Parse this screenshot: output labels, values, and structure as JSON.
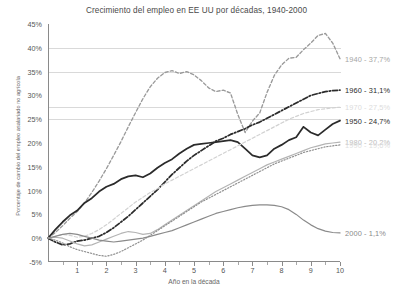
{
  "chart_data": {
    "type": "line",
    "title": "Crecimiento del empleo en EE UU por décadas, 1940-2000",
    "xlabel": "Año en la década",
    "ylabel": "Porcentaje de cambio del empleo asalariado no agrícola",
    "xlim": [
      0,
      10
    ],
    "ylim": [
      -5,
      45
    ],
    "grid": true,
    "legend_position": "right-end-labels",
    "yticks": [
      "-5%",
      "0%",
      "5%",
      "10%",
      "15%",
      "20%",
      "25%",
      "30%",
      "35%",
      "40%",
      "45%"
    ],
    "ytick_values": [
      -5,
      0,
      5,
      10,
      15,
      20,
      25,
      30,
      35,
      40,
      45
    ],
    "xticks": [
      "1",
      "2",
      "3",
      "4",
      "5",
      "6",
      "7",
      "8",
      "9",
      "10"
    ],
    "xtick_values": [
      1,
      2,
      3,
      4,
      5,
      6,
      7,
      8,
      9,
      10
    ],
    "x": [
      0,
      0.25,
      0.5,
      0.75,
      1,
      1.25,
      1.5,
      1.75,
      2,
      2.25,
      2.5,
      2.75,
      3,
      3.25,
      3.5,
      3.75,
      4,
      4.25,
      4.5,
      4.75,
      5,
      5.25,
      5.5,
      5.75,
      6,
      6.25,
      6.5,
      6.75,
      7,
      7.25,
      7.5,
      7.75,
      8,
      8.25,
      8.5,
      8.75,
      9,
      9.25,
      9.5,
      9.75,
      10
    ],
    "series": [
      {
        "name": "1940",
        "label": "1940 - 37,7%",
        "final_value": 37.7,
        "color": "#9a9a9a",
        "style": "dashed",
        "values": [
          0,
          1.2,
          2.6,
          4.2,
          5.6,
          7.4,
          9.6,
          12.0,
          14.6,
          17.4,
          20.3,
          23.4,
          26.4,
          29.3,
          31.8,
          33.6,
          34.8,
          35.2,
          34.6,
          35.0,
          34.3,
          33.1,
          31.6,
          30.8,
          31.1,
          30.5,
          26.0,
          22.2,
          24.6,
          26.3,
          30.6,
          34.2,
          36.4,
          37.8,
          38.0,
          39.6,
          41.0,
          42.6,
          43.0,
          41.0,
          37.7
        ]
      },
      {
        "name": "1950",
        "label": "1950 - 24,7%",
        "final_value": 24.7,
        "color": "#2b2b2b",
        "style": "solid",
        "values": [
          0,
          1.8,
          3.4,
          4.8,
          5.8,
          7.4,
          8.4,
          9.8,
          10.8,
          11.4,
          12.4,
          13.0,
          13.2,
          12.8,
          13.6,
          14.8,
          15.8,
          16.6,
          17.8,
          18.8,
          19.6,
          19.8,
          20.0,
          20.2,
          20.4,
          20.6,
          20.2,
          18.8,
          17.4,
          17.0,
          17.4,
          18.8,
          19.6,
          20.6,
          21.2,
          23.4,
          22.2,
          21.6,
          22.8,
          24.0,
          24.7
        ]
      },
      {
        "name": "1960",
        "label": "1960 - 31,1%",
        "final_value": 31.1,
        "color": "#2b2b2b",
        "style": "dashdot",
        "values": [
          0,
          -0.8,
          -1.4,
          -1.2,
          -0.6,
          -0.4,
          0.0,
          0.4,
          1.2,
          2.2,
          3.4,
          4.6,
          6.0,
          7.4,
          8.8,
          10.2,
          11.8,
          13.4,
          14.8,
          16.2,
          17.4,
          18.4,
          19.4,
          20.4,
          21.0,
          21.8,
          22.4,
          23.0,
          23.8,
          24.4,
          25.2,
          26.0,
          26.8,
          27.6,
          28.4,
          29.2,
          30.0,
          30.4,
          30.8,
          31.0,
          31.1
        ]
      },
      {
        "name": "1970",
        "label": "1970 - 27,5%",
        "final_value": 27.5,
        "color": "#d2d2d2",
        "style": "dashed",
        "values": [
          0,
          0.4,
          0.8,
          0.6,
          0.2,
          0.4,
          1.0,
          1.8,
          2.8,
          4.0,
          5.2,
          6.4,
          7.6,
          8.6,
          9.6,
          10.4,
          11.4,
          12.2,
          13.0,
          13.8,
          14.6,
          15.4,
          16.2,
          17.0,
          17.8,
          18.6,
          19.4,
          20.2,
          21.0,
          21.8,
          22.6,
          23.4,
          24.2,
          25.0,
          25.6,
          26.2,
          26.6,
          27.0,
          27.2,
          27.4,
          27.5
        ]
      },
      {
        "name": "1980",
        "label": "1980 - 20,2%",
        "final_value": 20.2,
        "color": "#b4b4b4",
        "style": "solid",
        "values": [
          0,
          0.2,
          0.0,
          -0.6,
          -1.2,
          -1.6,
          -1.4,
          -0.8,
          -0.2,
          0.4,
          1.0,
          1.4,
          1.2,
          0.8,
          1.0,
          1.8,
          2.8,
          3.8,
          4.8,
          5.8,
          6.8,
          7.8,
          8.8,
          9.8,
          10.6,
          11.4,
          12.2,
          13.0,
          13.8,
          14.6,
          15.4,
          16.0,
          16.6,
          17.2,
          17.8,
          18.4,
          19.0,
          19.4,
          19.8,
          20.0,
          20.2
        ]
      },
      {
        "name": "1990",
        "label": "1990 - 19,6%",
        "final_value": 19.6,
        "color": "#8f8f8f",
        "style": "dotted",
        "values": [
          0,
          -0.4,
          -1.0,
          -1.8,
          -2.4,
          -2.8,
          -3.2,
          -3.6,
          -3.8,
          -3.4,
          -2.8,
          -2.0,
          -1.2,
          -0.4,
          0.6,
          1.6,
          2.6,
          3.6,
          4.6,
          5.6,
          6.6,
          7.6,
          8.4,
          9.2,
          10.0,
          10.8,
          11.6,
          12.4,
          13.2,
          14.0,
          14.8,
          15.6,
          16.2,
          16.8,
          17.4,
          18.0,
          18.4,
          18.8,
          19.2,
          19.4,
          19.6
        ]
      },
      {
        "name": "2000",
        "label": "2000 - 1,1%",
        "final_value": 1.1,
        "color": "#8a8a8a",
        "style": "solid",
        "values": [
          0,
          0.4,
          0.8,
          1.0,
          0.8,
          0.4,
          0.0,
          -0.4,
          -0.6,
          -0.8,
          -0.6,
          -0.4,
          -0.2,
          0.0,
          0.4,
          0.8,
          1.2,
          1.6,
          2.2,
          2.8,
          3.4,
          4.0,
          4.6,
          5.2,
          5.6,
          6.0,
          6.4,
          6.7,
          6.9,
          7.0,
          7.0,
          6.9,
          6.6,
          6.0,
          5.0,
          3.8,
          2.8,
          2.0,
          1.5,
          1.2,
          1.1
        ]
      }
    ]
  }
}
